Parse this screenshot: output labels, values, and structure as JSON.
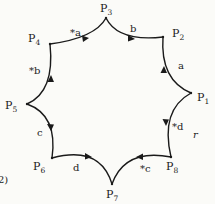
{
  "figure_number_fragment": "2)",
  "stray_mark": "r",
  "vertices": [
    {
      "id": "P1",
      "base": "P",
      "sub": "1",
      "x": 191,
      "y": 93,
      "lx": 197,
      "ly": 101
    },
    {
      "id": "P2",
      "base": "P",
      "sub": "2",
      "x": 163,
      "y": 37,
      "lx": 172,
      "ly": 37
    },
    {
      "id": "P3",
      "base": "P",
      "sub": "3",
      "x": 106,
      "y": 18,
      "lx": 100,
      "ly": 12
    },
    {
      "id": "P4",
      "base": "P",
      "sub": "4",
      "x": 50,
      "y": 44,
      "lx": 28,
      "ly": 42
    },
    {
      "id": "P5",
      "base": "P",
      "sub": "5",
      "x": 27,
      "y": 104,
      "lx": 5,
      "ly": 109
    },
    {
      "id": "P6",
      "base": "P",
      "sub": "6",
      "x": 52,
      "y": 158,
      "lx": 33,
      "ly": 170
    },
    {
      "id": "P7",
      "base": "P",
      "sub": "7",
      "x": 112,
      "y": 184,
      "lx": 106,
      "ly": 198
    },
    {
      "id": "P8",
      "base": "P",
      "sub": "8",
      "x": 171,
      "y": 157,
      "lx": 166,
      "ly": 170
    }
  ],
  "edges": [
    {
      "from": "P4",
      "to": "P3",
      "label": "*a",
      "lx": 70,
      "ly": 36
    },
    {
      "from": "P3",
      "to": "P2",
      "label": "b",
      "lx": 130,
      "ly": 32
    },
    {
      "from": "P1",
      "to": "P2",
      "label": "a",
      "lx": 178,
      "ly": 69
    },
    {
      "from": "P1",
      "to": "P8",
      "label": "*d",
      "lx": 172,
      "ly": 130
    },
    {
      "from": "P8",
      "to": "P7",
      "label": "*c",
      "lx": 140,
      "ly": 172
    },
    {
      "from": "P6",
      "to": "P7",
      "label": "d",
      "lx": 73,
      "ly": 171
    },
    {
      "from": "P5",
      "to": "P6",
      "label": "c",
      "lx": 37,
      "ly": 136
    },
    {
      "from": "P5",
      "to": "P4",
      "label": "*b",
      "lx": 29,
      "ly": 74
    }
  ]
}
